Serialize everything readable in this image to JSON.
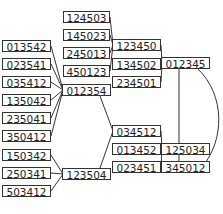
{
  "diagram": {
    "type": "graph",
    "nodes": [
      {
        "id": "124503",
        "label": "124503",
        "x": 63,
        "y": 11,
        "w": 47
      },
      {
        "id": "145023",
        "label": "145023",
        "x": 63,
        "y": 29,
        "w": 47
      },
      {
        "id": "245013",
        "label": "245013",
        "x": 63,
        "y": 47,
        "w": 47
      },
      {
        "id": "450123",
        "label": "450123",
        "x": 63,
        "y": 65,
        "w": 47
      },
      {
        "id": "013542",
        "label": "013542",
        "x": 2,
        "y": 40,
        "w": 49
      },
      {
        "id": "023541",
        "label": "023541",
        "x": 2,
        "y": 58,
        "w": 49
      },
      {
        "id": "035412",
        "label": "035412",
        "x": 2,
        "y": 76,
        "w": 49
      },
      {
        "id": "135042",
        "label": "135042",
        "x": 2,
        "y": 94,
        "w": 49
      },
      {
        "id": "235041",
        "label": "235041",
        "x": 2,
        "y": 112,
        "w": 49
      },
      {
        "id": "350412",
        "label": "350412",
        "x": 2,
        "y": 130,
        "w": 49
      },
      {
        "id": "150342",
        "label": "150342",
        "x": 2,
        "y": 149,
        "w": 49
      },
      {
        "id": "250341",
        "label": "250341",
        "x": 2,
        "y": 167,
        "w": 49
      },
      {
        "id": "503412",
        "label": "503412",
        "x": 2,
        "y": 185,
        "w": 49
      },
      {
        "id": "012354",
        "label": "012354",
        "x": 62,
        "y": 84,
        "w": 49
      },
      {
        "id": "123504",
        "label": "123504",
        "x": 62,
        "y": 168,
        "w": 49
      },
      {
        "id": "123450",
        "label": "123450",
        "x": 112,
        "y": 39,
        "w": 49
      },
      {
        "id": "134502",
        "label": "134502",
        "x": 112,
        "y": 58,
        "w": 49
      },
      {
        "id": "234501",
        "label": "234501",
        "x": 112,
        "y": 76,
        "w": 49
      },
      {
        "id": "012345",
        "label": "012345",
        "x": 161,
        "y": 57,
        "w": 49
      },
      {
        "id": "034512",
        "label": "034512",
        "x": 112,
        "y": 125,
        "w": 49
      },
      {
        "id": "013452",
        "label": "013452",
        "x": 112,
        "y": 143,
        "w": 49
      },
      {
        "id": "023451",
        "label": "023451",
        "x": 112,
        "y": 161,
        "w": 49
      },
      {
        "id": "125034",
        "label": "125034",
        "x": 161,
        "y": 143,
        "w": 49
      },
      {
        "id": "345012",
        "label": "345012",
        "x": 161,
        "y": 161,
        "w": 49
      }
    ],
    "edges": [
      [
        "124503",
        "123450"
      ],
      [
        "145023",
        "123450"
      ],
      [
        "245013",
        "123450"
      ],
      [
        "450123",
        "123450"
      ],
      [
        "013542",
        "012354"
      ],
      [
        "023541",
        "012354"
      ],
      [
        "035412",
        "012354"
      ],
      [
        "135042",
        "012354"
      ],
      [
        "235041",
        "012354"
      ],
      [
        "350412",
        "012354"
      ],
      [
        "150342",
        "123504"
      ],
      [
        "250341",
        "123504"
      ],
      [
        "503412",
        "123504"
      ],
      [
        "123450",
        "012345"
      ],
      [
        "134502",
        "012345"
      ],
      [
        "234501",
        "012345"
      ],
      [
        "012354",
        "034512"
      ],
      [
        "123504",
        "034512"
      ],
      [
        "034512",
        "125034"
      ],
      [
        "013452",
        "125034"
      ],
      [
        "023451",
        "125034"
      ],
      [
        "012345",
        "125034"
      ],
      [
        "125034",
        "345012"
      ],
      [
        "012345",
        "345012"
      ]
    ]
  }
}
